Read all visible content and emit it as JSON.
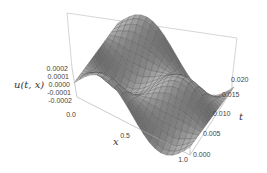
{
  "chart_data": {
    "type": "surface3d",
    "title": "",
    "xlabel": "x",
    "ylabel": "t",
    "zlabel": "u(t, x)",
    "xlim": [
      0.0,
      1.0
    ],
    "ylim": [
      0.0,
      0.02
    ],
    "zlim": [
      -0.0002,
      0.0002
    ],
    "x_ticks": [
      "0.0",
      "0.5",
      "1.0"
    ],
    "t_ticks": [
      "0.000",
      "0.005",
      "0.010",
      "0.015",
      "0.020"
    ],
    "z_ticks": [
      "0.0002",
      "0.0001",
      "0.0000",
      "-0.0001",
      "-0.0002"
    ],
    "surface_description": "u(t,x) ≈ 0.0002·sin(2πx)·cos(2π·t/0.02)-like wave surface, zero at x=0 and x=1, oscillating along t with ~1 period over [0,0.02]",
    "grid": "mesh lines on surface",
    "box": true
  },
  "labels": {
    "zlabel": "u(t, x)",
    "xlabel": "x",
    "tlabel": "t"
  }
}
